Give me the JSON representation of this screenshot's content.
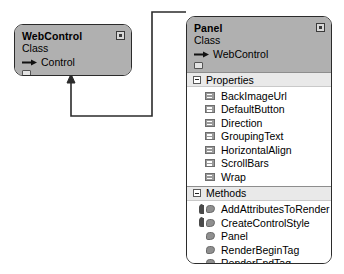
{
  "diagram": {
    "type": "uml-class-diagram",
    "relationship": {
      "kind": "inheritance",
      "from": "Panel",
      "to": "WebControl",
      "arrow": "open-arrow"
    },
    "colors": {
      "header_fill": "#b0b0b0",
      "section_bar": "#e9e9e9",
      "body_fill": "#ffffff",
      "border": "#2b2b2b",
      "icon_grey": "#8f8f8f"
    }
  },
  "boxes": [
    {
      "id": "webcontrol",
      "title": "WebControl",
      "stereotype": "Class",
      "base_icon": "inheritance-arrow-icon",
      "base_class": "Control",
      "collapse_icon": "collapse-button-icon",
      "folder_icon": "namespace-folder-icon",
      "sections": []
    },
    {
      "id": "panel",
      "title": "Panel",
      "stereotype": "Class",
      "base_icon": "inheritance-arrow-icon",
      "base_class": "WebControl",
      "collapse_icon": "collapse-button-icon",
      "folder_icon": "namespace-folder-icon",
      "sections": [
        {
          "id": "properties",
          "label": "Properties",
          "expander": "expander-minus-icon",
          "members": [
            {
              "name": "BackImageUrl",
              "icon": "property-icon",
              "override": false
            },
            {
              "name": "DefaultButton",
              "icon": "property-icon",
              "override": false
            },
            {
              "name": "Direction",
              "icon": "property-icon",
              "override": false
            },
            {
              "name": "GroupingText",
              "icon": "property-icon",
              "override": false
            },
            {
              "name": "HorizontalAlign",
              "icon": "property-icon",
              "override": false
            },
            {
              "name": "ScrollBars",
              "icon": "property-icon",
              "override": false
            },
            {
              "name": "Wrap",
              "icon": "property-icon",
              "override": false
            }
          ]
        },
        {
          "id": "methods",
          "label": "Methods",
          "expander": "expander-minus-icon",
          "members": [
            {
              "name": "AddAttributesToRender",
              "icon": "method-icon",
              "override": true
            },
            {
              "name": "CreateControlStyle",
              "icon": "method-icon",
              "override": true
            },
            {
              "name": "Panel",
              "icon": "method-icon",
              "override": false
            },
            {
              "name": "RenderBeginTag",
              "icon": "method-icon",
              "override": false
            },
            {
              "name": "RenderEndTag",
              "icon": "method-icon",
              "override": false
            }
          ]
        }
      ]
    }
  ]
}
